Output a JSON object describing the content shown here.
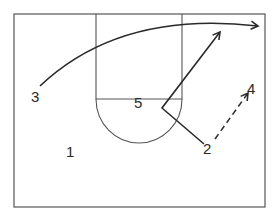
{
  "diagram": {
    "type": "basketball-half-court-play",
    "colors": {
      "lines": "#4a4a4a",
      "paths": "#2a2a2a",
      "background": "#ffffff"
    },
    "players": [
      {
        "id": "p1",
        "label": "1",
        "x": 24,
        "y": 151
      },
      {
        "id": "p2",
        "label": "2",
        "x": 203,
        "y": 154
      },
      {
        "id": "p3",
        "label": "3",
        "x": 31,
        "y": 102
      },
      {
        "id": "p4",
        "label": "4",
        "x": 247,
        "y": 94
      },
      {
        "id": "p5",
        "label": "5",
        "x": 134,
        "y": 108
      }
    ],
    "actions": [
      {
        "name": "player-3-cut",
        "kind": "cut",
        "from": "3",
        "style": "solid-curve-arrow"
      },
      {
        "name": "player-2-cut",
        "kind": "cut",
        "from": "2",
        "style": "solid-angled-arrow"
      },
      {
        "name": "pass-2-to-4",
        "kind": "pass",
        "from": "2",
        "to": "4",
        "style": "dashed-arrow"
      }
    ]
  }
}
